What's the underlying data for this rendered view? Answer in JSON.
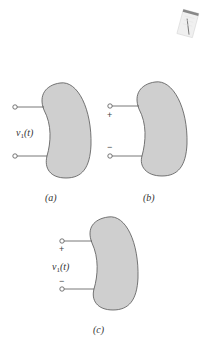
{
  "figure": {
    "colors": {
      "blob_fill": "#cfcfcf",
      "blob_stroke": "#555555",
      "wire": "#555555",
      "terminal_fill": "#ffffff"
    },
    "notepad_icon": {
      "name": "notepad-icon"
    },
    "panels": [
      {
        "id": "a",
        "caption": "(a)",
        "voltage_label": "v1(t)",
        "voltage_main": "v",
        "voltage_sub": "1",
        "voltage_arg": "(t)",
        "plus": "",
        "minus": ""
      },
      {
        "id": "b",
        "caption": "(b)",
        "voltage_label": "",
        "plus": "+",
        "minus": "−"
      },
      {
        "id": "c",
        "caption": "(c)",
        "voltage_label": "v1(t)",
        "voltage_main": "v",
        "voltage_sub": "1",
        "voltage_arg": "(t)",
        "plus": "+",
        "minus": "−"
      }
    ]
  }
}
